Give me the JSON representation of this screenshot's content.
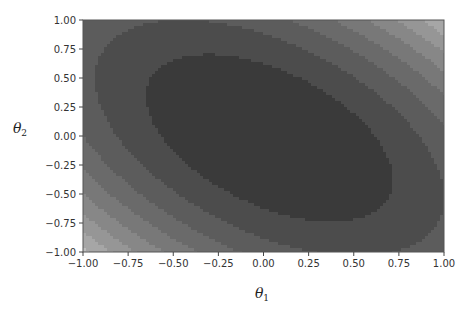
{
  "chart_data": {
    "type": "contour",
    "title": "",
    "xlabel": "θ1",
    "ylabel": "θ2",
    "xlim": [
      -1.0,
      1.0
    ],
    "ylim": [
      -1.0,
      1.0
    ],
    "xticks": [
      "−1.00",
      "−0.75",
      "−0.50",
      "−0.25",
      "0.00",
      "0.25",
      "0.50",
      "0.75",
      "1.00"
    ],
    "yticks": [
      "1.00",
      "0.75",
      "0.50",
      "0.25",
      "0.00",
      "−0.25",
      "−0.50",
      "−0.75",
      "−1.00"
    ],
    "grid": false,
    "legend": null,
    "colormap": "gray",
    "function": "f(θ1,θ2) = θ1² + θ2² + θ1·θ2 (approx. quadratic bowl, minimum near origin)",
    "levels": [
      0.0,
      0.35,
      0.7,
      1.05,
      1.4,
      1.75,
      2.1,
      2.45,
      2.8,
      3.2
    ],
    "level_colors": [
      "#3a3a3a",
      "#4c4c4c",
      "#5c5c5c",
      "#6a6a6a",
      "#787878",
      "#878787",
      "#969696",
      "#a6a6a6",
      "#bdbdbd",
      "#d6d6d6"
    ],
    "center": [
      0.0,
      0.0
    ],
    "orientation": "major axis from upper-left to lower-right"
  },
  "labels": {
    "xlabel_main": "θ",
    "xlabel_sub": "1",
    "ylabel_main": "θ",
    "ylabel_sub": "2"
  }
}
